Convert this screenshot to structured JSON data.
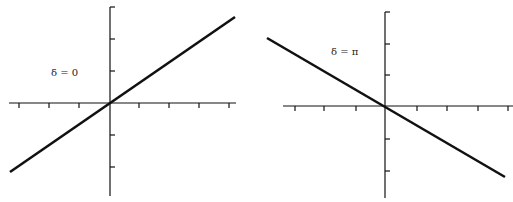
{
  "panels": [
    {
      "id": "left",
      "label": "δ = 0",
      "axes": {
        "origin": [
          110,
          103
        ],
        "x_axis": [
          9,
          236
        ],
        "y_axis": [
          7,
          196
        ],
        "x_ticks": [
          19,
          49,
          79,
          139,
          169,
          199,
          229
        ],
        "y_ticks": [
          7,
          39,
          71,
          135,
          167
        ],
        "tick_len": 5
      },
      "line": [
        10,
        172,
        235,
        17
      ],
      "label_pos": [
        51,
        67
      ]
    },
    {
      "id": "right",
      "label": "δ = π",
      "axes": {
        "origin": [
          385,
          106
        ],
        "x_axis": [
          283,
          513
        ],
        "y_axis": [
          12,
          198
        ],
        "x_ticks": [
          295,
          324,
          356,
          417,
          447,
          478,
          508
        ],
        "y_ticks": [
          12,
          44,
          75,
          139,
          171
        ],
        "tick_len": 5
      },
      "line": [
        267,
        38,
        505,
        177
      ],
      "label_pos": [
        331,
        46
      ]
    }
  ],
  "style": {
    "stroke": "#111111",
    "axis_width": 1.2,
    "line_width": 2.6
  }
}
